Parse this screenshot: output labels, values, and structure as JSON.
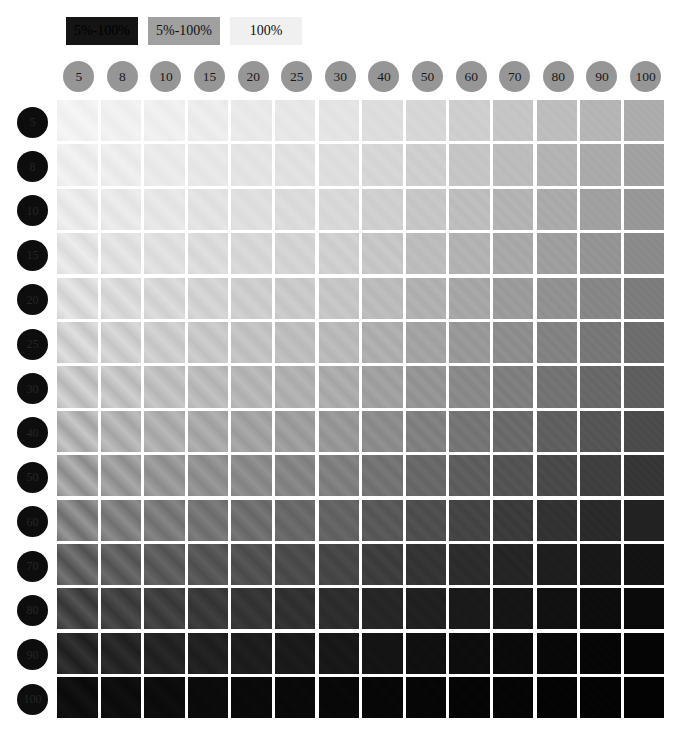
{
  "legend": {
    "items": [
      {
        "label": "5%-100%",
        "bg": "#141414",
        "fg": "#000000"
      },
      {
        "label": "5%-100%",
        "bg": "#a0a0a0",
        "fg": "#111111"
      },
      {
        "label": "100%",
        "bg": "#f0f0f0",
        "fg": "#111111"
      }
    ]
  },
  "header": {
    "circle_fill": "#969696",
    "circle_text": "#1a1a1a",
    "row_circle_fill": "#0d0d0d",
    "row_circle_text": "#262626"
  },
  "chart_data": {
    "type": "heatmap",
    "title": "",
    "xlabel": "",
    "ylabel": "",
    "grid": false,
    "legend_position": "top-left",
    "categories": [
      "5",
      "8",
      "10",
      "15",
      "20",
      "25",
      "30",
      "40",
      "50",
      "60",
      "70",
      "80",
      "90",
      "100"
    ],
    "rows": [
      "5",
      "8",
      "10",
      "15",
      "20",
      "25",
      "30",
      "40",
      "50",
      "60",
      "70",
      "80",
      "90",
      "100"
    ],
    "note": "Each cell renders a diagonal sinusoidal grating; cell mean luminance decreases with row index (contrast level) and column index (spatial frequency).",
    "values": [
      [
        242,
        240,
        239,
        236,
        233,
        231,
        228,
        221,
        214,
        206,
        197,
        189,
        181,
        172
      ],
      [
        238,
        236,
        234,
        231,
        228,
        225,
        222,
        214,
        206,
        197,
        188,
        179,
        170,
        161
      ],
      [
        234,
        232,
        230,
        226,
        223,
        219,
        216,
        207,
        198,
        189,
        179,
        170,
        160,
        151
      ],
      [
        228,
        225,
        223,
        219,
        215,
        211,
        207,
        198,
        188,
        178,
        168,
        158,
        148,
        138
      ],
      [
        220,
        217,
        214,
        210,
        205,
        201,
        197,
        187,
        176,
        166,
        155,
        145,
        134,
        124
      ],
      [
        210,
        207,
        204,
        199,
        194,
        189,
        185,
        174,
        163,
        152,
        141,
        130,
        119,
        109
      ],
      [
        198,
        195,
        191,
        186,
        181,
        176,
        171,
        160,
        148,
        137,
        126,
        115,
        104,
        94
      ],
      [
        181,
        177,
        174,
        168,
        162,
        157,
        151,
        140,
        128,
        117,
        106,
        95,
        85,
        75
      ],
      [
        158,
        154,
        150,
        144,
        138,
        132,
        127,
        115,
        104,
        93,
        83,
        73,
        63,
        54
      ],
      [
        130,
        126,
        122,
        116,
        110,
        104,
        99,
        88,
        78,
        68,
        59,
        50,
        42,
        34
      ],
      [
        98,
        94,
        91,
        85,
        80,
        75,
        70,
        61,
        52,
        44,
        37,
        30,
        24,
        19
      ],
      [
        68,
        65,
        62,
        57,
        53,
        49,
        45,
        38,
        32,
        26,
        21,
        17,
        13,
        10
      ],
      [
        40,
        38,
        35,
        32,
        29,
        26,
        24,
        20,
        16,
        13,
        10,
        8,
        6,
        5
      ],
      [
        14,
        13,
        12,
        11,
        10,
        9,
        8,
        7,
        6,
        5,
        5,
        4,
        4,
        3
      ]
    ],
    "contrast": [
      [
        0.05,
        0.06,
        0.07,
        0.08,
        0.09,
        0.1,
        0.11,
        0.13,
        0.15,
        0.17,
        0.19,
        0.21,
        0.23,
        0.25
      ],
      [
        0.07,
        0.08,
        0.09,
        0.1,
        0.11,
        0.12,
        0.13,
        0.16,
        0.18,
        0.2,
        0.22,
        0.24,
        0.26,
        0.28
      ],
      [
        0.09,
        0.1,
        0.11,
        0.12,
        0.14,
        0.15,
        0.16,
        0.19,
        0.21,
        0.23,
        0.26,
        0.28,
        0.3,
        0.32
      ],
      [
        0.12,
        0.13,
        0.15,
        0.16,
        0.18,
        0.19,
        0.21,
        0.24,
        0.26,
        0.29,
        0.31,
        0.34,
        0.36,
        0.38
      ],
      [
        0.16,
        0.17,
        0.19,
        0.21,
        0.23,
        0.24,
        0.26,
        0.29,
        0.32,
        0.35,
        0.37,
        0.4,
        0.42,
        0.44
      ],
      [
        0.2,
        0.22,
        0.24,
        0.26,
        0.28,
        0.3,
        0.32,
        0.35,
        0.38,
        0.41,
        0.44,
        0.46,
        0.48,
        0.5
      ],
      [
        0.26,
        0.28,
        0.3,
        0.32,
        0.34,
        0.36,
        0.38,
        0.42,
        0.45,
        0.48,
        0.5,
        0.53,
        0.55,
        0.57
      ],
      [
        0.33,
        0.35,
        0.37,
        0.4,
        0.42,
        0.44,
        0.46,
        0.5,
        0.53,
        0.56,
        0.59,
        0.61,
        0.63,
        0.65
      ],
      [
        0.42,
        0.44,
        0.46,
        0.49,
        0.51,
        0.53,
        0.55,
        0.59,
        0.62,
        0.65,
        0.68,
        0.7,
        0.72,
        0.74
      ],
      [
        0.52,
        0.54,
        0.56,
        0.59,
        0.61,
        0.63,
        0.65,
        0.69,
        0.72,
        0.75,
        0.77,
        0.79,
        0.81,
        0.83
      ],
      [
        0.62,
        0.64,
        0.66,
        0.69,
        0.71,
        0.73,
        0.75,
        0.78,
        0.81,
        0.83,
        0.85,
        0.87,
        0.89,
        0.9
      ],
      [
        0.72,
        0.74,
        0.76,
        0.78,
        0.8,
        0.82,
        0.83,
        0.86,
        0.88,
        0.9,
        0.92,
        0.93,
        0.94,
        0.95
      ],
      [
        0.82,
        0.83,
        0.85,
        0.86,
        0.88,
        0.89,
        0.9,
        0.92,
        0.94,
        0.95,
        0.96,
        0.97,
        0.97,
        0.98
      ],
      [
        0.92,
        0.93,
        0.93,
        0.94,
        0.95,
        0.95,
        0.96,
        0.97,
        0.97,
        0.98,
        0.98,
        0.99,
        0.99,
        0.99
      ]
    ],
    "frequencies_cpd": [
      5,
      8,
      10,
      15,
      20,
      25,
      30,
      40,
      50,
      60,
      70,
      80,
      90,
      100
    ],
    "grating_angle_deg": 45
  }
}
